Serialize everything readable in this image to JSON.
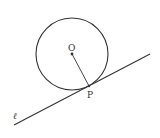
{
  "diagram": {
    "labels": {
      "center": "O",
      "tangent_point": "P",
      "line": "ℓ"
    },
    "colors": {
      "stroke": "#333333",
      "background": "#ffffff"
    },
    "geometry": {
      "circle": {
        "cx": 72,
        "cy": 54,
        "r": 36
      },
      "center_point": {
        "x": 72,
        "y": 54
      },
      "tangent_point": {
        "x": 89,
        "y": 86
      },
      "line": {
        "x1": 14,
        "y1": 125,
        "x2": 150,
        "y2": 54
      }
    }
  }
}
